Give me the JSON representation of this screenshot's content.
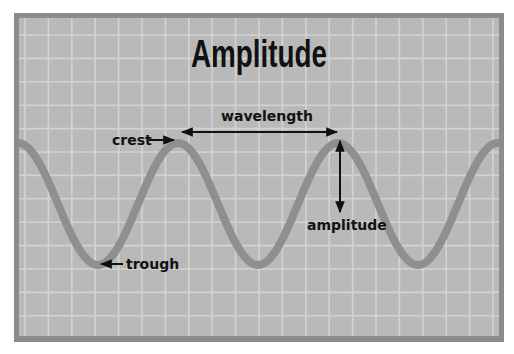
{
  "title": "Amplitude",
  "labels": {
    "wavelength": "wavelength",
    "crest": "crest",
    "amplitude": "amplitude",
    "trough": "trough"
  },
  "colors": {
    "page_background": "#ffffff",
    "panel_background": "#b9b9b9",
    "grid_line": "#d3d3d3",
    "border": "#8c8c8c",
    "wave": "#8f8f8f",
    "text": "#111111",
    "arrow": "#111111"
  },
  "wave": {
    "period_px": 160,
    "amplitude_px": 61,
    "center_y": 204,
    "first_crest_x": 18
  }
}
